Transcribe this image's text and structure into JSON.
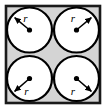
{
  "figure": {
    "frame": {
      "shape_name": "square-frame",
      "x": 6,
      "y": 6,
      "width": 94,
      "height": 97,
      "fill_color": "#d4d4d4",
      "stroke_color": "#1a1a1a",
      "stroke_width": 2.6
    },
    "circles": [
      {
        "id": "circle-top-left",
        "cx": 29.5,
        "cy": 30.0,
        "r": 22.5,
        "fill_color": "#ffffff",
        "stroke_color": "#000000",
        "stroke_width": 2.2,
        "center_dot_r": 2.6,
        "center_dot_color": "#000000",
        "arrow": {
          "direction": "up-left",
          "tip_x": 12.2,
          "tip_y": 15.5,
          "stroke_color": "#000000",
          "stroke_width": 1.5
        },
        "label": {
          "text": "r",
          "x": 25.5,
          "y": 21.5,
          "anchor": "middle"
        }
      },
      {
        "id": "circle-top-right",
        "cx": 76.5,
        "cy": 30.0,
        "r": 22.5,
        "fill_color": "#ffffff",
        "stroke_color": "#000000",
        "stroke_width": 2.2,
        "center_dot_r": 2.6,
        "center_dot_color": "#000000",
        "arrow": {
          "direction": "up-right",
          "tip_x": 93.8,
          "tip_y": 15.5,
          "stroke_color": "#000000",
          "stroke_width": 1.5
        },
        "label": {
          "text": "r",
          "x": 73.0,
          "y": 22.0,
          "anchor": "middle"
        }
      },
      {
        "id": "circle-bottom-left",
        "cx": 29.5,
        "cy": 78.5,
        "r": 22.5,
        "fill_color": "#ffffff",
        "stroke_color": "#000000",
        "stroke_width": 2.2,
        "center_dot_r": 2.6,
        "center_dot_color": "#000000",
        "arrow": {
          "direction": "down-left",
          "tip_x": 12.2,
          "tip_y": 93.5,
          "stroke_color": "#000000",
          "stroke_width": 1.5
        },
        "label": {
          "text": "r",
          "x": 26.5,
          "y": 95.0,
          "anchor": "middle"
        }
      },
      {
        "id": "circle-bottom-right",
        "cx": 76.5,
        "cy": 78.5,
        "r": 22.5,
        "fill_color": "#ffffff",
        "stroke_color": "#000000",
        "stroke_width": 2.2,
        "center_dot_r": 2.6,
        "center_dot_color": "#000000",
        "arrow": {
          "direction": "down-right",
          "tip_x": 93.8,
          "tip_y": 93.5,
          "stroke_color": "#000000",
          "stroke_width": 1.5
        },
        "label": {
          "text": "r",
          "x": 73.0,
          "y": 95.0,
          "anchor": "middle"
        }
      }
    ],
    "colors": {
      "background": "#ffffff",
      "square_fill": "#d4d4d4",
      "circle_fill": "#ffffff",
      "ink": "#000000",
      "frame_stroke": "#1a1a1a"
    },
    "labels": {
      "radius_symbol": "r"
    }
  }
}
